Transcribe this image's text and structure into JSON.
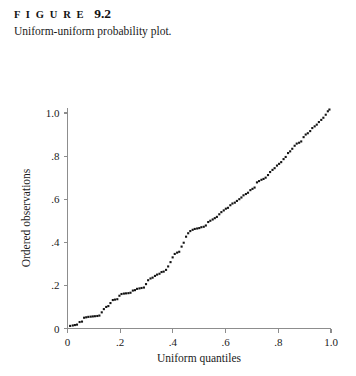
{
  "figure": {
    "label": "F I G U R E",
    "number": "9.2",
    "caption": "Uniform-uniform probability plot."
  },
  "chart_data": {
    "type": "scatter",
    "title": "Uniform-uniform probability plot.",
    "xlabel": "Uniform quantiles",
    "ylabel": "Ordered observations",
    "xlim": [
      0,
      1.05
    ],
    "ylim": [
      0,
      1.05
    ],
    "xticks": [
      0,
      0.2,
      0.4,
      0.6,
      0.8,
      1.0
    ],
    "xticklabels": [
      "0",
      ".2",
      ".4",
      ".6",
      ".8",
      "1.0"
    ],
    "yticks": [
      0,
      0.2,
      0.4,
      0.6,
      0.8,
      1.0
    ],
    "yticklabels": [
      "0",
      ".2",
      ".4",
      ".6",
      ".8",
      "1.0"
    ],
    "grid": false,
    "legend": null,
    "marker": "square",
    "marker_color": "#141414",
    "marker_size": 2.1,
    "points": [
      [
        0.01,
        0.012
      ],
      [
        0.02,
        0.014
      ],
      [
        0.028,
        0.016
      ],
      [
        0.036,
        0.018
      ],
      [
        0.046,
        0.03
      ],
      [
        0.055,
        0.032
      ],
      [
        0.063,
        0.05
      ],
      [
        0.071,
        0.052
      ],
      [
        0.079,
        0.054
      ],
      [
        0.088,
        0.055
      ],
      [
        0.096,
        0.056
      ],
      [
        0.104,
        0.057
      ],
      [
        0.113,
        0.058
      ],
      [
        0.121,
        0.06
      ],
      [
        0.13,
        0.075
      ],
      [
        0.138,
        0.09
      ],
      [
        0.147,
        0.1
      ],
      [
        0.155,
        0.104
      ],
      [
        0.163,
        0.118
      ],
      [
        0.172,
        0.132
      ],
      [
        0.18,
        0.134
      ],
      [
        0.189,
        0.136
      ],
      [
        0.197,
        0.152
      ],
      [
        0.205,
        0.16
      ],
      [
        0.214,
        0.162
      ],
      [
        0.222,
        0.163
      ],
      [
        0.231,
        0.164
      ],
      [
        0.239,
        0.166
      ],
      [
        0.248,
        0.176
      ],
      [
        0.256,
        0.178
      ],
      [
        0.264,
        0.184
      ],
      [
        0.273,
        0.186
      ],
      [
        0.281,
        0.188
      ],
      [
        0.29,
        0.19
      ],
      [
        0.298,
        0.206
      ],
      [
        0.306,
        0.224
      ],
      [
        0.315,
        0.232
      ],
      [
        0.323,
        0.236
      ],
      [
        0.332,
        0.244
      ],
      [
        0.34,
        0.25
      ],
      [
        0.349,
        0.254
      ],
      [
        0.357,
        0.262
      ],
      [
        0.365,
        0.264
      ],
      [
        0.374,
        0.272
      ],
      [
        0.382,
        0.288
      ],
      [
        0.391,
        0.308
      ],
      [
        0.399,
        0.33
      ],
      [
        0.407,
        0.346
      ],
      [
        0.416,
        0.352
      ],
      [
        0.424,
        0.356
      ],
      [
        0.433,
        0.38
      ],
      [
        0.441,
        0.398
      ],
      [
        0.45,
        0.426
      ],
      [
        0.458,
        0.442
      ],
      [
        0.466,
        0.452
      ],
      [
        0.475,
        0.458
      ],
      [
        0.483,
        0.462
      ],
      [
        0.492,
        0.464
      ],
      [
        0.5,
        0.466
      ],
      [
        0.508,
        0.47
      ],
      [
        0.517,
        0.472
      ],
      [
        0.525,
        0.478
      ],
      [
        0.534,
        0.494
      ],
      [
        0.542,
        0.5
      ],
      [
        0.551,
        0.506
      ],
      [
        0.559,
        0.512
      ],
      [
        0.567,
        0.518
      ],
      [
        0.576,
        0.53
      ],
      [
        0.584,
        0.54
      ],
      [
        0.593,
        0.548
      ],
      [
        0.601,
        0.556
      ],
      [
        0.609,
        0.56
      ],
      [
        0.618,
        0.572
      ],
      [
        0.626,
        0.58
      ],
      [
        0.635,
        0.584
      ],
      [
        0.643,
        0.592
      ],
      [
        0.652,
        0.6
      ],
      [
        0.66,
        0.608
      ],
      [
        0.668,
        0.618
      ],
      [
        0.677,
        0.624
      ],
      [
        0.685,
        0.63
      ],
      [
        0.694,
        0.642
      ],
      [
        0.702,
        0.648
      ],
      [
        0.71,
        0.654
      ],
      [
        0.719,
        0.678
      ],
      [
        0.727,
        0.684
      ],
      [
        0.736,
        0.69
      ],
      [
        0.744,
        0.694
      ],
      [
        0.752,
        0.7
      ],
      [
        0.761,
        0.712
      ],
      [
        0.769,
        0.726
      ],
      [
        0.778,
        0.736
      ],
      [
        0.786,
        0.744
      ],
      [
        0.795,
        0.756
      ],
      [
        0.803,
        0.764
      ],
      [
        0.811,
        0.772
      ],
      [
        0.82,
        0.786
      ],
      [
        0.828,
        0.796
      ],
      [
        0.837,
        0.814
      ],
      [
        0.845,
        0.822
      ],
      [
        0.853,
        0.834
      ],
      [
        0.862,
        0.848
      ],
      [
        0.87,
        0.858
      ],
      [
        0.879,
        0.862
      ],
      [
        0.887,
        0.868
      ],
      [
        0.896,
        0.888
      ],
      [
        0.904,
        0.9
      ],
      [
        0.912,
        0.906
      ],
      [
        0.921,
        0.916
      ],
      [
        0.929,
        0.93
      ],
      [
        0.938,
        0.938
      ],
      [
        0.946,
        0.946
      ],
      [
        0.954,
        0.958
      ],
      [
        0.963,
        0.968
      ],
      [
        0.971,
        0.978
      ],
      [
        0.98,
        0.992
      ],
      [
        0.988,
        1.008
      ],
      [
        0.994,
        1.016
      ]
    ]
  }
}
